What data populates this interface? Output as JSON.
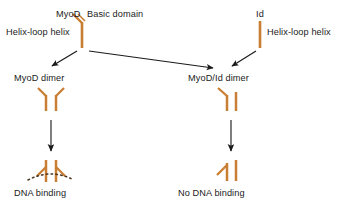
{
  "figure": {
    "background_color": "#ffffff",
    "protein_color": "#c87e33",
    "arrow_color": "#1b1b1b",
    "dna_color": "#4a3520",
    "text_color": "#1b1b1b"
  },
  "labels": {
    "myod": "MyoD",
    "basic_domain": "Basic domain",
    "helix_loop_helix_left": "Helix-loop helix",
    "id": "Id",
    "helix_loop_helix_right": "Helix-loop helix",
    "myod_dimer": "MyoD dimer",
    "myod_id_dimer": "MyoD/Id dimer",
    "dna_binding": "DNA binding",
    "no_dna_binding": "No DNA binding"
  },
  "nodes": [
    {
      "id": "myod-monomer",
      "label": "MyoD",
      "type": "monomer",
      "has_basic_domain": true,
      "annotations": [
        "MyoD",
        "Basic domain",
        "Helix-loop helix"
      ]
    },
    {
      "id": "id-monomer",
      "label": "Id",
      "type": "monomer",
      "has_basic_domain": false,
      "annotations": [
        "Id",
        "Helix-loop helix"
      ]
    },
    {
      "id": "myod-dimer",
      "label": "MyoD dimer",
      "type": "homodimer",
      "basic_domain_arms": 2
    },
    {
      "id": "myod-id-dimer",
      "label": "MyoD/Id dimer",
      "type": "heterodimer",
      "basic_domain_arms": 1
    },
    {
      "id": "dna-binding-complex",
      "label": "DNA binding",
      "type": "homodimer-on-dna",
      "basic_domain_arms": 2,
      "dna_present": true
    },
    {
      "id": "no-dna-binding-complex",
      "label": "No DNA binding",
      "type": "heterodimer-free",
      "basic_domain_arms": 1,
      "dna_present": false
    }
  ],
  "edges": [
    {
      "from": "myod-monomer",
      "to": "myod-dimer",
      "style": "arrow"
    },
    {
      "from": "myod-monomer",
      "to": "myod-id-dimer",
      "style": "arrow"
    },
    {
      "from": "id-monomer",
      "to": "myod-id-dimer",
      "style": "arrow"
    },
    {
      "from": "myod-dimer",
      "to": "dna-binding-complex",
      "style": "arrow"
    },
    {
      "from": "myod-id-dimer",
      "to": "no-dna-binding-complex",
      "style": "arrow"
    }
  ]
}
